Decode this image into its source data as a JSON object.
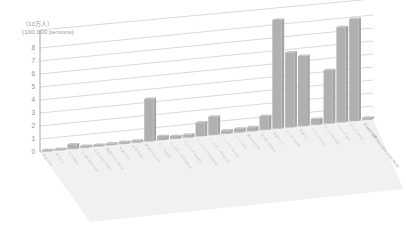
{
  "chart_data": {
    "type": "bar",
    "title": "",
    "subtitle": "",
    "unit_label_ja": "（10万人）",
    "unit_label_en": "(100,000 persons)",
    "ylabel": "(100,000 persons)",
    "xlabel": "",
    "ylim": [
      0,
      8
    ],
    "yticks": [
      0,
      1,
      2,
      3,
      4,
      5,
      6,
      7,
      8
    ],
    "ytick_labels": [
      "0",
      "1",
      "2",
      "3",
      "4",
      "5",
      "6",
      "7",
      "8"
    ],
    "grid": true,
    "legend": "none",
    "projection": "3d-perspective",
    "bar_color": "#b0b0b0",
    "categories": [
      "市区 Cities",
      "町 Towns",
      "村 Villages",
      "その他 Other Cities",
      "日本 Japan / Nippon",
      "韓国 Korea, Rep. of",
      "中国 China",
      "台湾 Taiwan",
      "香港 Hong Kong",
      "タイ Thailand",
      "シンガポール Singapore",
      "マレーシア Malaysia",
      "インドネシア Indonesia",
      "フィリピン Philippines",
      "ベトナム Viet Nam",
      "インド India",
      "豪州 Australia",
      "NZ New Zealand",
      "米国 U.S.A.",
      "カナダ Canada",
      "英国 U.K.",
      "フランス France",
      "ドイツ Germany",
      "イタリア Italy",
      "ロシア Russia",
      "その他の地域 Other parts of the World"
    ],
    "categories_short": [
      "市区",
      "町",
      "村",
      "その他",
      "日本",
      "韓国",
      "中国",
      "台湾",
      "香港",
      "タイ",
      "シンガポール",
      "マレーシア",
      "インドネシア",
      "フィリピン",
      "ベトナム",
      "インド",
      "豪州",
      "NZ",
      "米国",
      "カナダ",
      "英国",
      "フランス",
      "ドイツ",
      "イタリア",
      "ロシア",
      "その他の地域"
    ],
    "values": [
      0.1,
      0.1,
      0.35,
      0.12,
      0.1,
      0.12,
      0.15,
      0.15,
      3.25,
      0.3,
      0.2,
      0.22,
      1.05,
      1.4,
      0.25,
      0.28,
      0.3,
      1.05,
      8.35,
      5.75,
      5.4,
      0.45,
      4.1,
      7.3,
      7.85,
      0.15
    ],
    "value_unit": "100,000 persons",
    "max_value": 8.35,
    "series_name": ""
  },
  "colors": {
    "bar": "#b0b0b0",
    "grid": "#bfbfbf",
    "axis": "#999999",
    "floor": "#f1f1f1",
    "text": "#8f8f8f",
    "label": "#bdbdbd",
    "background": "#ffffff"
  }
}
